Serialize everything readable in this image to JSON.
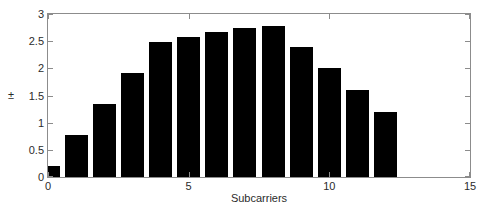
{
  "chart_data": {
    "type": "bar",
    "title": "",
    "xlabel": "Subcarriers",
    "ylabel": "±",
    "x": [
      0,
      1,
      2,
      3,
      4,
      5,
      6,
      7,
      8,
      9,
      10,
      11,
      12
    ],
    "values": [
      0.2,
      0.77,
      1.35,
      1.92,
      2.49,
      2.58,
      2.66,
      2.75,
      2.78,
      2.4,
      2.0,
      1.6,
      1.2
    ],
    "categories": [
      "0",
      "1",
      "2",
      "3",
      "4",
      "5",
      "6",
      "7",
      "8",
      "9",
      "10",
      "11",
      "12"
    ],
    "bar_color": "#000000",
    "bar_width": 0.82,
    "xlim": [
      0,
      15
    ],
    "ylim": [
      0,
      3
    ],
    "xticks": [
      0,
      5,
      10,
      15
    ],
    "xtick_labels": [
      "0",
      "5",
      "10",
      "15"
    ],
    "yticks": [
      0,
      0.5,
      1,
      1.5,
      2,
      2.5,
      3
    ],
    "ytick_labels": [
      "0",
      "0.5",
      "1",
      "1.5",
      "2",
      "2.5",
      "3"
    ],
    "grid": false,
    "legend": null,
    "axis_color": "#8c8c8c",
    "background_color": "#ffffff"
  }
}
